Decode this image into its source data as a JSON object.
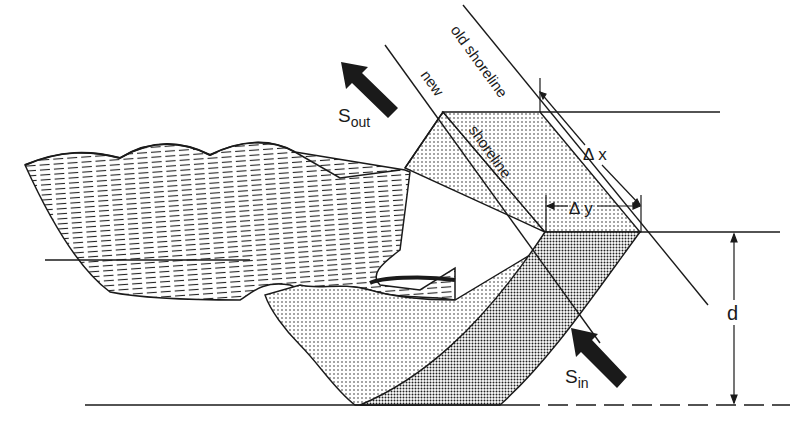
{
  "diagram": {
    "type": "shoreline sediment budget schematic",
    "labels": {
      "old_shoreline": "old shoreline",
      "new": "new",
      "shoreline": "shoreline",
      "delta_x": "Δ x",
      "delta_y": "Δ y",
      "depth": "d",
      "s_out_main": "S",
      "s_out_sub": "out",
      "s_in_main": "S",
      "s_in_sub": "in"
    },
    "colors": {
      "ink": "#1a1a1a",
      "light_stipple": "#d9d9d9",
      "dark_stipple": "#8c8c8c",
      "background": "#ffffff"
    }
  }
}
